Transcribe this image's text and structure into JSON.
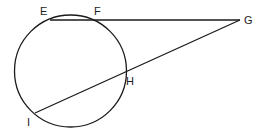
{
  "diagram": {
    "type": "circle with tangent-secant",
    "points": {
      "E": {
        "label": "E",
        "x": 50,
        "y": 20
      },
      "F": {
        "label": "F",
        "x": 92,
        "y": 20
      },
      "G": {
        "label": "G",
        "x": 240,
        "y": 20
      },
      "H": {
        "label": "H",
        "x": 126,
        "y": 72
      },
      "I": {
        "label": "I",
        "x": 35,
        "y": 113
      }
    },
    "circle": {
      "cx": 70.5,
      "cy": 71,
      "r": 56
    },
    "stroke_color": "#1a1a1a"
  }
}
